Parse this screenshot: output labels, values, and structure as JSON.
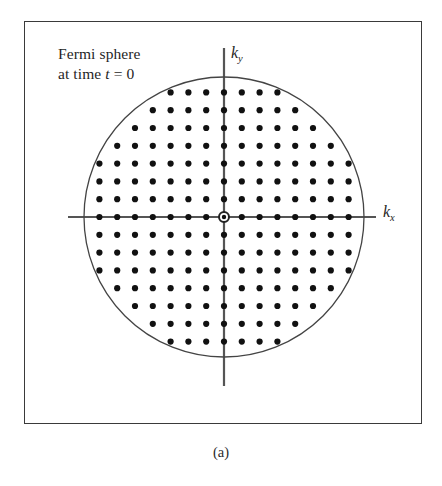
{
  "figure": {
    "caption": "(a)",
    "annotation": {
      "line1": "Fermi sphere",
      "line2_prefix": "at time ",
      "line2_variable": "t",
      "line2_suffix": " = 0"
    },
    "axes": {
      "x_label_base": "k",
      "x_label_sub": "x",
      "y_label_base": "k",
      "y_label_sub": "y"
    },
    "colors": {
      "frame": "#3a3a3a",
      "axis": "#555555",
      "circle": "#444444",
      "dot": "#111111",
      "origin_ring": "#222222",
      "background": "#ffffff",
      "text": "#1f1f1f"
    }
  },
  "chart_data": {
    "type": "scatter",
    "title": "Fermi sphere at time t = 0",
    "xlabel": "k_x",
    "ylabel": "k_y",
    "grid": false,
    "legend": null,
    "geometry": {
      "origin_px": [
        224,
        217
      ],
      "fermi_radius_px": 140,
      "lattice_spacing_px": 17.8,
      "lattice_type": "square",
      "dot_radius_px": 3.1,
      "origin_ring_outer_radius_px": 5.0,
      "origin_ring_inner_radius_px": 2.2
    },
    "axis_extent_px": {
      "x_axis_start": 68,
      "x_axis_end": 376,
      "y_axis_start": 48,
      "y_axis_end": 386
    },
    "lattice_units": {
      "radius_in_spacings": 7.87,
      "x_index_range": [
        -7,
        7
      ],
      "y_index_range": [
        -7,
        7
      ]
    },
    "annotations": [
      {
        "text": "Fermi sphere at time t = 0",
        "position_px": [
          58,
          44
        ],
        "anchor": "top-left"
      }
    ],
    "xlim": [
      -8.0,
      8.0
    ],
    "ylim": [
      -8.0,
      8.0
    ]
  }
}
